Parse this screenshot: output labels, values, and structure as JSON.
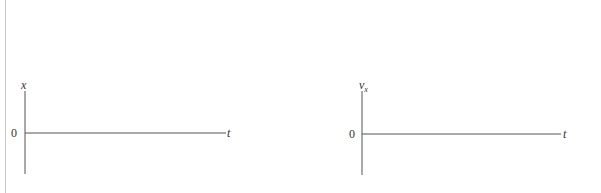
{
  "graphs": [
    {
      "id": "position-time",
      "y_axis_label": "x",
      "y_axis_subscript": "",
      "x_axis_label": "t",
      "origin_label": "0"
    },
    {
      "id": "velocity-time",
      "y_axis_label": "v",
      "y_axis_subscript": "x",
      "x_axis_label": "t",
      "origin_label": "0"
    }
  ],
  "colors": {
    "axis": "#555555",
    "border": "#c8c8c8",
    "background": "#ffffff"
  }
}
